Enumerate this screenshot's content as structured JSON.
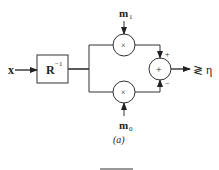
{
  "diagram": {
    "input_label": "x",
    "filter_block": {
      "base": "R",
      "superscript": "−1"
    },
    "multiplier_symbol": "×",
    "sum_symbol": "+",
    "top_weight": {
      "base": "m",
      "subscript": "1"
    },
    "bottom_weight": {
      "base": "m",
      "subscript": "0"
    },
    "top_sign": "+",
    "bottom_sign": "−",
    "decision": "≷ η",
    "caption": "(a)"
  }
}
